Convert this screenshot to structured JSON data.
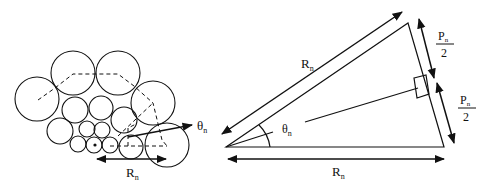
{
  "figure": {
    "left_panel": {
      "description": "Circle packing with dashed polygonal path",
      "labels": {
        "radius": "R",
        "radius_sub": "n",
        "angle": "θ",
        "angle_sub": "n"
      }
    },
    "right_panel": {
      "description": "Isosceles triangle with sides R_n, base split into two P_n/2 halves",
      "labels": {
        "hyp_radius": "R",
        "hyp_radius_sub": "n",
        "base_radius": "R",
        "base_radius_sub": "n",
        "angle": "θ",
        "angle_sub": "n",
        "half_p_top_num": "P",
        "half_p_top_sub": "n",
        "half_p_top_den": "2",
        "half_p_bot_num": "P",
        "half_p_bot_sub": "n",
        "half_p_bot_den": "2"
      }
    },
    "colors": {
      "stroke": "#111111",
      "background": "#ffffff"
    }
  }
}
